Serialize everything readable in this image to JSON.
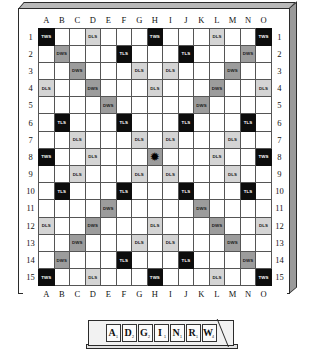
{
  "board": {
    "title": "Scrabble Board",
    "size": 15,
    "col_labels": [
      "A",
      "B",
      "C",
      "D",
      "E",
      "F",
      "G",
      "H",
      "I",
      "J",
      "K",
      "L",
      "M",
      "N",
      "O"
    ],
    "row_labels": [
      "1",
      "2",
      "3",
      "4",
      "5",
      "6",
      "7",
      "8",
      "9",
      "10",
      "11",
      "12",
      "13",
      "14",
      "15"
    ],
    "legend": {
      "tws_label": "TWS",
      "dws_label": "DWS",
      "tls_label": "TLS",
      "dls_label": "DLS",
      "center_glyph": "✹"
    },
    "colors": {
      "tws": "#0d0d0d",
      "tls": "#0d0d0d",
      "dws": "#9c9c9c",
      "dls": "#d4d4d4",
      "plain": "#ffffff",
      "grid_line": "#555555",
      "frame": "#2b2b2b",
      "bevel_top": "#b9b9b9",
      "bevel_right": "#9a9a9a"
    },
    "squares": [
      [
        "TWS",
        "",
        "",
        "DLS",
        "",
        "",
        "",
        "TWS",
        "",
        "",
        "",
        "DLS",
        "",
        "",
        "TWS"
      ],
      [
        "",
        "DWS",
        "",
        "",
        "",
        "TLS",
        "",
        "",
        "",
        "TLS",
        "",
        "",
        "",
        "DWS",
        ""
      ],
      [
        "",
        "",
        "DWS",
        "",
        "",
        "",
        "DLS",
        "",
        "DLS",
        "",
        "",
        "",
        "DWS",
        "",
        ""
      ],
      [
        "DLS",
        "",
        "",
        "DWS",
        "",
        "",
        "",
        "DLS",
        "",
        "",
        "",
        "DWS",
        "",
        "",
        "DLS"
      ],
      [
        "",
        "",
        "",
        "",
        "DWS",
        "",
        "",
        "",
        "",
        "",
        "DWS",
        "",
        "",
        "",
        ""
      ],
      [
        "",
        "TLS",
        "",
        "",
        "",
        "TLS",
        "",
        "",
        "",
        "TLS",
        "",
        "",
        "",
        "TLS",
        ""
      ],
      [
        "",
        "",
        "DLS",
        "",
        "",
        "",
        "DLS",
        "",
        "DLS",
        "",
        "",
        "",
        "DLS",
        "",
        ""
      ],
      [
        "TWS",
        "",
        "",
        "DLS",
        "",
        "",
        "",
        "CENTER",
        "",
        "",
        "",
        "DLS",
        "",
        "",
        "TWS"
      ],
      [
        "",
        "",
        "DLS",
        "",
        "",
        "",
        "DLS",
        "",
        "DLS",
        "",
        "",
        "",
        "DLS",
        "",
        ""
      ],
      [
        "",
        "TLS",
        "",
        "",
        "",
        "TLS",
        "",
        "",
        "",
        "TLS",
        "",
        "",
        "",
        "TLS",
        ""
      ],
      [
        "",
        "",
        "",
        "",
        "DWS",
        "",
        "",
        "",
        "",
        "",
        "DWS",
        "",
        "",
        "",
        ""
      ],
      [
        "DLS",
        "",
        "",
        "DWS",
        "",
        "",
        "",
        "DLS",
        "",
        "",
        "",
        "DWS",
        "",
        "",
        "DLS"
      ],
      [
        "",
        "",
        "DWS",
        "",
        "",
        "",
        "DLS",
        "",
        "DLS",
        "",
        "",
        "",
        "DWS",
        "",
        ""
      ],
      [
        "",
        "DWS",
        "",
        "",
        "",
        "TLS",
        "",
        "",
        "",
        "TLS",
        "",
        "",
        "",
        "DWS",
        ""
      ],
      [
        "TWS",
        "",
        "",
        "DLS",
        "",
        "",
        "",
        "TWS",
        "",
        "",
        "",
        "DLS",
        "",
        "",
        "TWS"
      ]
    ]
  },
  "rack": {
    "name": "tile-rack",
    "tiles": [
      {
        "letter": "A",
        "value": "1"
      },
      {
        "letter": "D",
        "value": "2"
      },
      {
        "letter": "G",
        "value": "2"
      },
      {
        "letter": "I",
        "value": "1"
      },
      {
        "letter": "N",
        "value": "1"
      },
      {
        "letter": "R",
        "value": "1"
      },
      {
        "letter": "W",
        "value": "4"
      }
    ]
  }
}
